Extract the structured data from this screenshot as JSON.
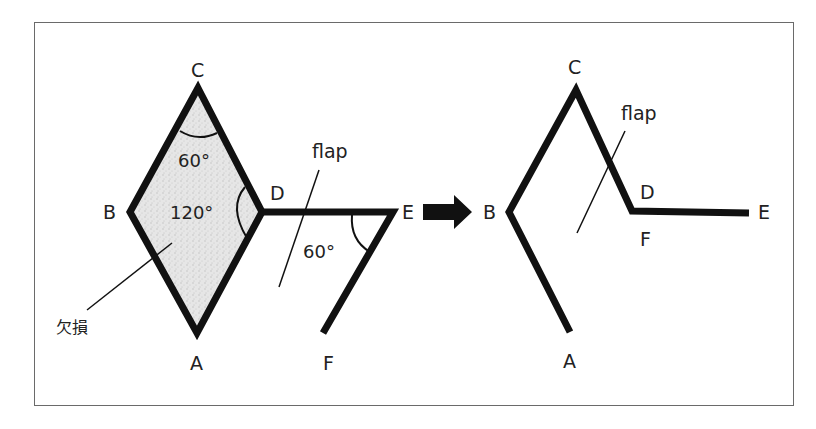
{
  "colors": {
    "stroke": "#111111",
    "text": "#222222",
    "frame": "#6a6a6a",
    "defect_fill": "#dcdcdc",
    "background": "#ffffff"
  },
  "left_figure": {
    "points": {
      "A": "A",
      "B": "B",
      "C": "C",
      "D": "D",
      "E": "E",
      "F": "F"
    },
    "angles": {
      "angle_C": "60°",
      "angle_D": "120°",
      "angle_E": "60°"
    },
    "defect_label": "欠損",
    "flap_label": "flap"
  },
  "arrow": {
    "icon": "right-arrow-icon"
  },
  "right_figure": {
    "points": {
      "A": "A",
      "B": "B",
      "C": "C",
      "D": "D",
      "E": "E",
      "F": "F"
    },
    "flap_label": "flap"
  }
}
